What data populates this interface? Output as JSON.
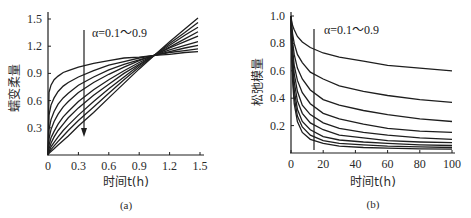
{
  "chart_data": [
    {
      "panel": "(a)",
      "type": "line",
      "title": "",
      "xlabel": "时间t(h)",
      "ylabel": "蠕变柔量",
      "xlim": [
        0,
        1.5
      ],
      "ylim": [
        0,
        1.5
      ],
      "xticks": [
        "0",
        "0.3",
        "0.6",
        "0.9",
        "1.2",
        "1.5"
      ],
      "yticks": [
        "0.3",
        "0.6",
        "0.9",
        "1.2",
        "1.5"
      ],
      "grid": false,
      "annotation": "α=0.1～0.9",
      "arrow": {
        "x": 0.35,
        "y_from": 1.43,
        "y_to": 0.22,
        "direction": "down"
      },
      "x": [
        0,
        0.01,
        0.03,
        0.06,
        0.1,
        0.15,
        0.2,
        0.3,
        0.45,
        0.6,
        0.75,
        0.9,
        1.05,
        1.2,
        1.35,
        1.48
      ],
      "series": [
        {
          "name": "α=0.1",
          "values": [
            0,
            0.69,
            0.77,
            0.83,
            0.87,
            0.91,
            0.93,
            0.97,
            1.01,
            1.04,
            1.07,
            1.08,
            1.1,
            1.11,
            1.13,
            1.14
          ]
        },
        {
          "name": "α=0.2",
          "values": [
            0,
            0.44,
            0.55,
            0.63,
            0.7,
            0.76,
            0.8,
            0.86,
            0.93,
            0.99,
            1.03,
            1.07,
            1.1,
            1.13,
            1.15,
            1.17
          ]
        },
        {
          "name": "α=0.3",
          "values": [
            0,
            0.28,
            0.39,
            0.48,
            0.56,
            0.63,
            0.68,
            0.77,
            0.86,
            0.94,
            1.0,
            1.05,
            1.1,
            1.14,
            1.18,
            1.21
          ]
        },
        {
          "name": "α=0.4",
          "values": [
            0,
            0.18,
            0.28,
            0.37,
            0.45,
            0.53,
            0.59,
            0.69,
            0.8,
            0.89,
            0.97,
            1.04,
            1.1,
            1.16,
            1.21,
            1.25
          ]
        },
        {
          "name": "α=0.5",
          "values": [
            0,
            0.11,
            0.19,
            0.26,
            0.34,
            0.42,
            0.48,
            0.59,
            0.72,
            0.83,
            0.93,
            1.02,
            1.1,
            1.18,
            1.25,
            1.31
          ]
        },
        {
          "name": "α=0.6",
          "values": [
            0,
            0.07,
            0.13,
            0.2,
            0.27,
            0.34,
            0.41,
            0.52,
            0.66,
            0.78,
            0.9,
            1.0,
            1.1,
            1.19,
            1.28,
            1.36
          ]
        },
        {
          "name": "α=0.7",
          "values": [
            0,
            0.04,
            0.09,
            0.14,
            0.2,
            0.27,
            0.33,
            0.44,
            0.59,
            0.73,
            0.86,
            0.99,
            1.1,
            1.21,
            1.32,
            1.41
          ]
        },
        {
          "name": "α=0.8",
          "values": [
            0,
            0.03,
            0.06,
            0.1,
            0.15,
            0.21,
            0.27,
            0.38,
            0.53,
            0.68,
            0.83,
            0.97,
            1.1,
            1.23,
            1.35,
            1.46
          ]
        },
        {
          "name": "α=0.9",
          "values": [
            0,
            0.02,
            0.04,
            0.07,
            0.11,
            0.16,
            0.21,
            0.32,
            0.47,
            0.63,
            0.79,
            0.95,
            1.1,
            1.25,
            1.39,
            1.51
          ]
        }
      ],
      "caption": "(a)"
    },
    {
      "panel": "(b)",
      "type": "line",
      "title": "",
      "xlabel": "时间t(h)",
      "ylabel": "松弛模量",
      "xlim": [
        0,
        100
      ],
      "ylim": [
        0,
        1.0
      ],
      "xticks": [
        "0",
        "20",
        "40",
        "60",
        "80",
        "100"
      ],
      "yticks": [
        "0.2",
        "0.4",
        "0.6",
        "0.8",
        "1.0"
      ],
      "grid": false,
      "annotation": "α=0.1～0.9",
      "marker_line": {
        "x": 13,
        "y_from": 0.92,
        "y_to": 0.02
      },
      "x": [
        0,
        0.3,
        1,
        2,
        4,
        7,
        12,
        20,
        30,
        45,
        60,
        80,
        100
      ],
      "series": [
        {
          "name": "α=0.1",
          "values": [
            1.0,
            0.97,
            0.93,
            0.9,
            0.85,
            0.81,
            0.77,
            0.73,
            0.7,
            0.67,
            0.64,
            0.62,
            0.6
          ]
        },
        {
          "name": "α=0.2",
          "values": [
            1.0,
            0.95,
            0.87,
            0.8,
            0.72,
            0.66,
            0.59,
            0.54,
            0.49,
            0.45,
            0.42,
            0.39,
            0.37
          ]
        },
        {
          "name": "α=0.3",
          "values": [
            1.0,
            0.92,
            0.81,
            0.72,
            0.62,
            0.54,
            0.46,
            0.39,
            0.35,
            0.31,
            0.28,
            0.25,
            0.23
          ]
        },
        {
          "name": "α=0.4",
          "values": [
            1.0,
            0.9,
            0.76,
            0.64,
            0.53,
            0.44,
            0.36,
            0.29,
            0.25,
            0.21,
            0.18,
            0.16,
            0.15
          ]
        },
        {
          "name": "α=0.5",
          "values": [
            1.0,
            0.88,
            0.71,
            0.58,
            0.45,
            0.35,
            0.28,
            0.22,
            0.18,
            0.15,
            0.13,
            0.11,
            0.1
          ]
        },
        {
          "name": "α=0.6",
          "values": [
            1.0,
            0.86,
            0.66,
            0.52,
            0.38,
            0.29,
            0.22,
            0.17,
            0.13,
            0.11,
            0.09,
            0.08,
            0.075
          ]
        },
        {
          "name": "α=0.7",
          "values": [
            1.0,
            0.83,
            0.62,
            0.46,
            0.32,
            0.23,
            0.17,
            0.12,
            0.095,
            0.08,
            0.07,
            0.06,
            0.055
          ]
        },
        {
          "name": "α=0.8",
          "values": [
            1.0,
            0.81,
            0.57,
            0.41,
            0.27,
            0.19,
            0.13,
            0.09,
            0.07,
            0.06,
            0.05,
            0.045,
            0.04
          ]
        },
        {
          "name": "α=0.9",
          "values": [
            1.0,
            0.79,
            0.53,
            0.36,
            0.23,
            0.15,
            0.1,
            0.07,
            0.05,
            0.04,
            0.035,
            0.03,
            0.028
          ]
        }
      ],
      "caption": "(b)"
    }
  ]
}
